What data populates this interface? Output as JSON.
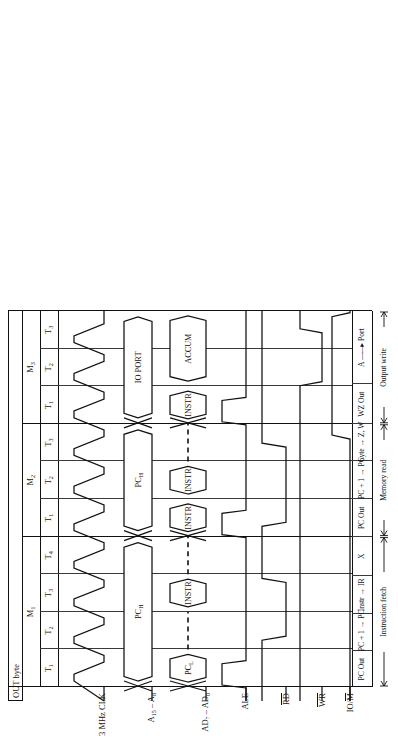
{
  "figure": {
    "title": "OUT byte",
    "clock_label": "3 MHz CLK"
  },
  "machine_cycles": [
    {
      "name": "M1",
      "states": [
        "T1",
        "T2",
        "T3",
        "T4"
      ]
    },
    {
      "name": "M2",
      "states": [
        "T1",
        "T2",
        "T3"
      ]
    },
    {
      "name": "M3",
      "states": [
        "T1",
        "T2",
        "T3"
      ]
    }
  ],
  "signals": [
    {
      "id": "clk",
      "label": "3 MHz CLK"
    },
    {
      "id": "ahi",
      "label": "A15 – A8",
      "label_main": "A",
      "sub_hi": "15",
      "sub_lo": "8"
    },
    {
      "id": "ad",
      "label": "AD7 – AD0",
      "label_main": "AD",
      "sub_hi": "7",
      "sub_lo": "0"
    },
    {
      "id": "ale",
      "label": "ALE",
      "overline": false
    },
    {
      "id": "rd",
      "label": "RD",
      "overline": true
    },
    {
      "id": "wr",
      "label": "WR",
      "overline": true
    },
    {
      "id": "iom",
      "label": "IO/M",
      "overline": true,
      "overline_part": "M"
    }
  ],
  "address_bus_values": [
    {
      "cycle": "M1",
      "text": "PCH"
    },
    {
      "cycle": "M2",
      "text": "PCH"
    },
    {
      "cycle": "M3",
      "text": "IO PORT"
    }
  ],
  "data_bus_values": [
    {
      "cycle": "M1",
      "state": "T1",
      "text": "PCL"
    },
    {
      "cycle": "M1",
      "state": "T3",
      "text": "INSTR"
    },
    {
      "cycle": "M2",
      "state": "T1",
      "text": "INSTR"
    },
    {
      "cycle": "M2",
      "state": "T2",
      "text": "INSTR"
    },
    {
      "cycle": "M3",
      "state": "T1",
      "text": "INSTR"
    },
    {
      "cycle": "M3",
      "state": "T2",
      "text": "ACCUM"
    }
  ],
  "annotation_row": [
    "PC Out",
    "PC + 1 → PC",
    "Instr → IR",
    "X",
    "PC Out",
    "PC + 1 → PC",
    "byte → Z, W",
    "WZ Out",
    "A —→ Port"
  ],
  "annotation_cells": [
    {
      "text": "PC Out"
    },
    {
      "text": "PC + 1 → PC"
    },
    {
      "text": "Instr → IR"
    },
    {
      "text": "X"
    },
    {
      "text": "PC Out"
    },
    {
      "text": "PC + 1 → PC"
    },
    {
      "text": "byte → Z, W"
    },
    {
      "text": "WZ Out"
    },
    {
      "text": "A → Port",
      "arrow": true,
      "left": "A",
      "right": "Port"
    }
  ],
  "phase_bars": [
    {
      "label": "Instruction fetch"
    },
    {
      "label": "Memory read"
    },
    {
      "label": "Output write"
    }
  ],
  "colors": {
    "ink": "#111111",
    "grid": "#3a3a3a",
    "background": "#ffffff"
  }
}
